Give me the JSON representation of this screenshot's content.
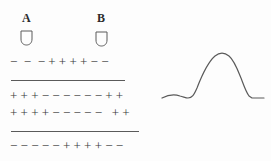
{
  "figure": {
    "background_color": "#fdfdfd",
    "ink_color": "#3a3a3a",
    "line_color": "#5a5a5a"
  },
  "left_panel": {
    "name": "membrane-charge-diagram",
    "probes": [
      {
        "id": "A",
        "label": "A",
        "glyph": "electrode-cup-icon"
      },
      {
        "id": "B",
        "label": "B",
        "glyph": "electrode-cup-icon"
      }
    ],
    "charge_rows": [
      {
        "id": "row-0",
        "text": "−  −  − + + + + − −",
        "sequence": [
          "-",
          "-",
          "-",
          "+",
          "+",
          "+",
          "+",
          "-",
          "-"
        ]
      },
      {
        "id": "row-1",
        "text": "+ + + − − − − − − + +",
        "sequence": [
          "+",
          "+",
          "+",
          "-",
          "-",
          "-",
          "-",
          "-",
          "-",
          "+",
          "+"
        ]
      },
      {
        "id": "row-2",
        "text": "+ + + + − − − − −   + +",
        "sequence": [
          "+",
          "+",
          "+",
          "+",
          "-",
          "-",
          "-",
          "-",
          "-",
          " ",
          "+",
          "+"
        ]
      },
      {
        "id": "row-3",
        "text": "− − − − − + + + + − −",
        "sequence": [
          "-",
          "-",
          "-",
          "-",
          "-",
          "+",
          "+",
          "+",
          "+",
          "-",
          "-"
        ]
      }
    ],
    "membrane_lines": [
      {
        "id": "membrane-line-0"
      },
      {
        "id": "membrane-line-1"
      }
    ]
  },
  "right_panel": {
    "name": "action-potential-trace",
    "curve_path": "M 2,53 C 8,50 14,49 20,51 C 24,52 26,53 28,53 C 32,53 34,50 37,43 C 42,30 48,17 55,11 C 60,7 64,7 69,11 C 74,15 77,23 81,33 C 84,41 86,47 89,51 L 92,53 L 104,53",
    "stroke_color": "#5a5a5a",
    "stroke_width": 1.2
  }
}
